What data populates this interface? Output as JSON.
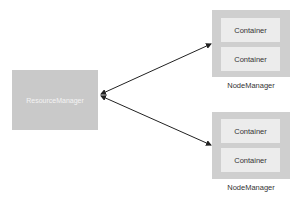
{
  "resource_manager": {
    "label": "ResourceManager"
  },
  "node_managers": [
    {
      "label": "NodeManager",
      "containers": [
        "Container",
        "Container"
      ]
    },
    {
      "label": "NodeManager",
      "containers": [
        "Container",
        "Container"
      ]
    }
  ],
  "colors": {
    "rm_fill": "#c9c9c9",
    "nm_fill": "#cfcfcf",
    "container_fill": "#ececec",
    "arrow": "#222222"
  }
}
